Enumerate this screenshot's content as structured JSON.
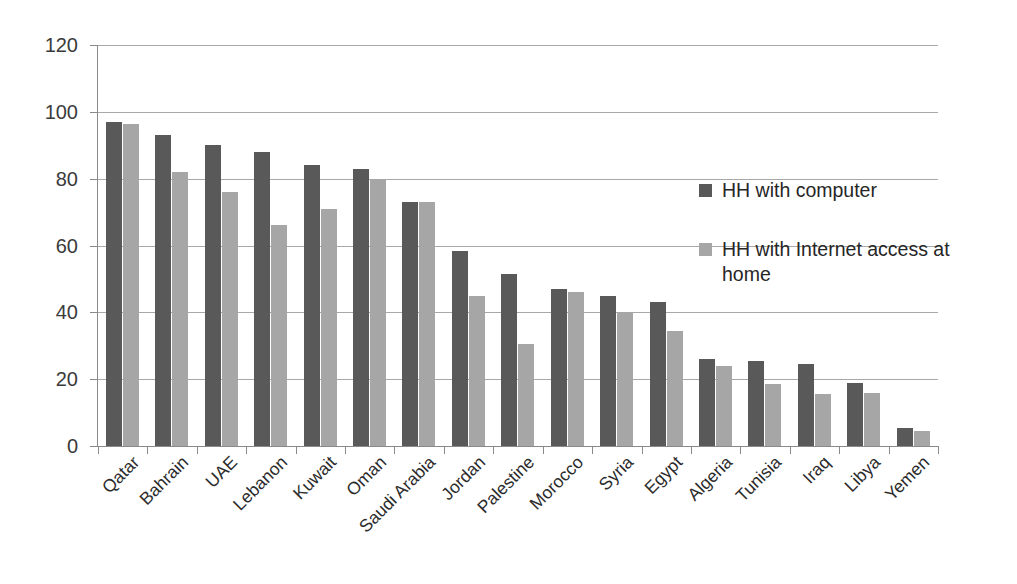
{
  "chart_data": {
    "type": "bar",
    "title": "",
    "subtitle": "",
    "xlabel": "",
    "ylabel": "",
    "ylim": [
      0,
      120
    ],
    "ytick_step": 20,
    "yticks": [
      0,
      20,
      40,
      60,
      80,
      100,
      120
    ],
    "grid": true,
    "legend_position": "inside-right",
    "categories": [
      "Qatar",
      "Bahrain",
      "UAE",
      "Lebanon",
      "Kuwait",
      "Oman",
      "Saudi Arabia",
      "Jordan",
      "Palestine",
      "Morocco",
      "Syria",
      "Egypt",
      "Algeria",
      "Tunisia",
      "Iraq",
      "Libya",
      "Yemen"
    ],
    "series": [
      {
        "name": "HH with computer",
        "color": "#595959",
        "values": [
          97,
          93,
          90,
          88,
          84,
          83,
          73,
          58.5,
          51.5,
          47,
          45,
          43,
          26,
          25.5,
          24.5,
          19,
          5.5
        ]
      },
      {
        "name": "HH with Internet access at home",
        "color": "#a6a6a6",
        "values": [
          96.5,
          82,
          76,
          66,
          71,
          80,
          73,
          45,
          30.5,
          46,
          40,
          34.5,
          24,
          18.5,
          15.5,
          16,
          4.5
        ]
      }
    ],
    "colors": {
      "series_computer": "#595959",
      "series_internet": "#a6a6a6",
      "gridline": "#a8a8a8",
      "axis": "#8a8a8a",
      "text": "#262626",
      "background": "#ffffff"
    }
  }
}
